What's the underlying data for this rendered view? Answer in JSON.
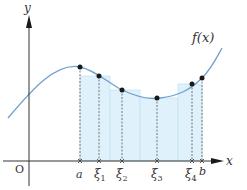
{
  "diagram": {
    "colors": {
      "curve": "#6f9fcf",
      "rect_fill": "#dff1fa",
      "rect_stroke": "#c8e3f2",
      "axis": "#333333",
      "point": "#1a1a1a",
      "guide": "#555555"
    },
    "axes": {
      "x_label": "x",
      "y_label": "y",
      "origin_label": "O"
    },
    "curve_label": "f(x)",
    "partition": {
      "start_label": "a",
      "end_label": "b",
      "sample_labels": [
        {
          "base": "ξ",
          "sub": "1"
        },
        {
          "base": "ξ",
          "sub": "2"
        },
        {
          "base": "ξ",
          "sub": "3"
        },
        {
          "base": "ξ",
          "sub": "4"
        }
      ]
    }
  }
}
